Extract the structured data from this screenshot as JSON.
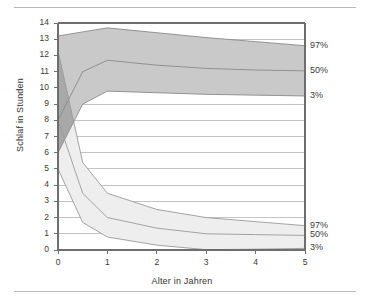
{
  "figure": {
    "has_top_rule": true,
    "has_bottom_rule": true
  },
  "chart_data": {
    "type": "area",
    "title": "",
    "subtitle": "",
    "xlabel": "Alter in Jahren",
    "ylabel": "Schlaf in Stunden",
    "xlim": [
      0,
      5
    ],
    "ylim": [
      0,
      14
    ],
    "grid": true,
    "grid_axis": "y",
    "legend_position": "right-outside",
    "x_ticks": [
      "0",
      "1",
      "2",
      "3",
      "4",
      "5"
    ],
    "x_tick_values": [
      0,
      1,
      2,
      3,
      4,
      5
    ],
    "y_ticks": [
      "0",
      "1",
      "2",
      "3",
      "4",
      "5",
      "6",
      "7",
      "8",
      "9",
      "10",
      "11",
      "12",
      "13",
      "14"
    ],
    "y_tick_values": [
      0,
      1,
      2,
      3,
      4,
      5,
      6,
      7,
      8,
      9,
      10,
      11,
      12,
      13,
      14
    ],
    "x": [
      0,
      0.5,
      1,
      2,
      3,
      4,
      5
    ],
    "bands": [
      {
        "name": "Gesamtschlaf",
        "fill": "#c9c9c9",
        "stroke": "#8a8a8a",
        "labels": [
          "97%",
          "50%",
          "3%"
        ],
        "label_values": [
          12.6,
          11.05,
          9.5
        ],
        "series": [
          {
            "name": "97%",
            "values": [
              13.2,
              13.45,
              13.7,
              13.4,
              13.1,
              12.85,
              12.6
            ]
          },
          {
            "name": "50%",
            "values": [
              8.0,
              11.0,
              11.7,
              11.4,
              11.2,
              11.1,
              11.05
            ]
          },
          {
            "name": "3%",
            "values": [
              6.0,
              9.0,
              9.8,
              9.7,
              9.6,
              9.55,
              9.5
            ]
          }
        ]
      },
      {
        "name": "Tagschlaf",
        "fill": "#eeeeee",
        "stroke": "#9a9a9a",
        "labels": [
          "97%",
          "50%",
          "3%"
        ],
        "label_values": [
          1.5,
          0.9,
          0.1
        ],
        "series": [
          {
            "name": "97%",
            "values": [
              12.3,
              5.4,
              3.5,
              2.5,
              2.0,
              1.75,
              1.5
            ]
          },
          {
            "name": "50%",
            "values": [
              8.0,
              3.5,
              2.0,
              1.35,
              1.0,
              0.95,
              0.9
            ]
          },
          {
            "name": "3%",
            "values": [
              5.0,
              1.7,
              0.8,
              0.3,
              0.02,
              0.05,
              0.1
            ]
          }
        ]
      }
    ],
    "overlap_fill": "#a8a8a8",
    "annotations": [
      {
        "text": "97%",
        "axis": "right",
        "value": 12.6
      },
      {
        "text": "50%",
        "axis": "right",
        "value": 11.05
      },
      {
        "text": "3%",
        "axis": "right",
        "value": 9.5
      },
      {
        "text": "97%",
        "axis": "right",
        "value": 1.5
      },
      {
        "text": "50%",
        "axis": "right",
        "value": 0.9
      },
      {
        "text": "3%",
        "axis": "right",
        "value": 0.1
      }
    ]
  },
  "colors": {
    "band_upper": "#c9c9c9",
    "band_lower": "#eeeeee",
    "overlap": "#a8a8a8",
    "grid": "#b5b5b5",
    "axis": "#6e6e6e",
    "rule": "#b9b9b9",
    "text": "#3a3a3a"
  }
}
